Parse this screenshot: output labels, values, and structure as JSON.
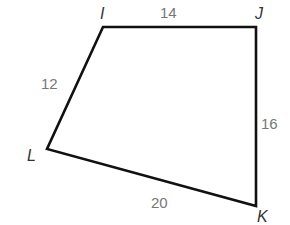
{
  "figure": {
    "shape": "quadrilateral",
    "stroke_color": "#111111",
    "vertices": [
      {
        "name": "I",
        "x": 103,
        "y": 27
      },
      {
        "name": "J",
        "x": 256,
        "y": 27
      },
      {
        "name": "K",
        "x": 256,
        "y": 206
      },
      {
        "name": "L",
        "x": 47,
        "y": 149
      }
    ],
    "vertex_labels": {
      "I": "I",
      "J": "J",
      "K": "K",
      "L": "L"
    },
    "side_labels": {
      "IJ": "14",
      "JK": "16",
      "KL": "20",
      "LI": "12"
    }
  }
}
